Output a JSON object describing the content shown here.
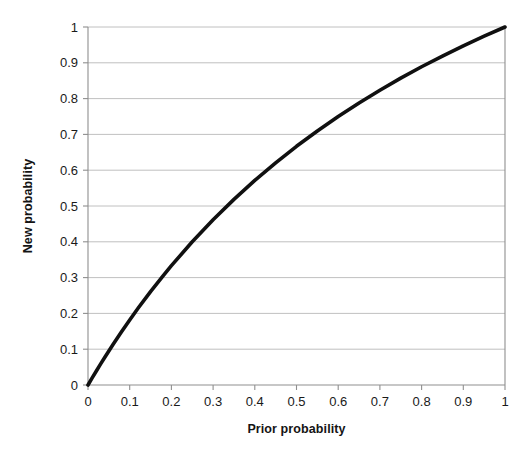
{
  "chart_data": {
    "type": "line",
    "title": "",
    "subtitle": "",
    "xlabel": "Prior probability",
    "ylabel": "New probability",
    "xlim": [
      0,
      1
    ],
    "ylim": [
      0,
      1
    ],
    "grid": "horizontal",
    "legend": "none",
    "annotations": [],
    "xticks": [
      "0",
      "0.1",
      "0.2",
      "0.3",
      "0.4",
      "0.5",
      "0.6",
      "0.7",
      "0.8",
      "0.9",
      "1"
    ],
    "yticks": [
      "0",
      "0.1",
      "0.2",
      "0.3",
      "0.4",
      "0.5",
      "0.6",
      "0.7",
      "0.8",
      "0.9",
      "1"
    ],
    "xtick_values": [
      0,
      0.1,
      0.2,
      0.3,
      0.4,
      0.5,
      0.6,
      0.7,
      0.8,
      0.9,
      1
    ],
    "ytick_values": [
      0,
      0.1,
      0.2,
      0.3,
      0.4,
      0.5,
      0.6,
      0.7,
      0.8,
      0.9,
      1
    ],
    "series": [
      {
        "name": "Posterior probability after update",
        "color": "#101010",
        "x": [
          0,
          0.01,
          0.02,
          0.03,
          0.04,
          0.05,
          0.06,
          0.08,
          0.1,
          0.12,
          0.15,
          0.18,
          0.2,
          0.25,
          0.3,
          0.35,
          0.4,
          0.45,
          0.5,
          0.55,
          0.6,
          0.65,
          0.7,
          0.75,
          0.8,
          0.85,
          0.9,
          0.95,
          1
        ],
        "y": [
          0,
          0.0198,
          0.0392,
          0.0583,
          0.0769,
          0.0952,
          0.1132,
          0.1481,
          0.1818,
          0.2143,
          0.2609,
          0.3051,
          0.3333,
          0.4,
          0.4615,
          0.5185,
          0.5714,
          0.6207,
          0.6667,
          0.7097,
          0.75,
          0.7879,
          0.8235,
          0.8571,
          0.8889,
          0.9189,
          0.9474,
          0.9744,
          1
        ]
      }
    ]
  },
  "axis": {
    "x_title": "Prior probability",
    "y_title": "New probability"
  },
  "colors": {
    "curve": "#101010",
    "gridline": "#b9b9b9",
    "axis": "#8f8f8f",
    "text": "#1a1a1a",
    "background": "#ffffff"
  }
}
